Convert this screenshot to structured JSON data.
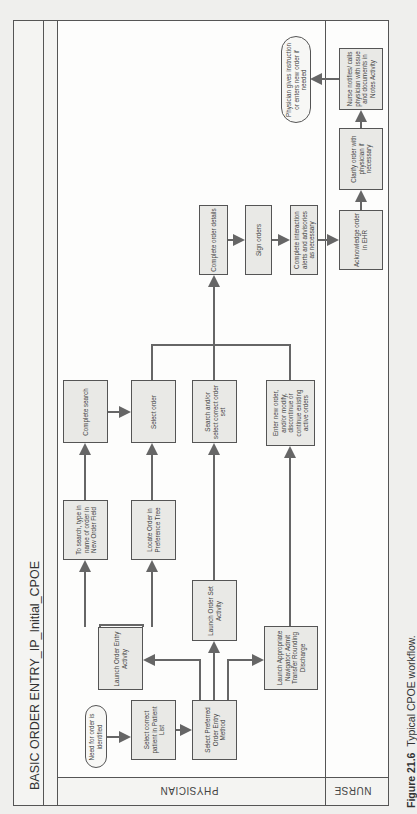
{
  "diagram": {
    "title": "BASIC ORDER ENTRY_IP_Initial_CPOE",
    "lanes": [
      {
        "id": "physician",
        "label": "PHYSICIAN"
      },
      {
        "id": "nurse",
        "label": "NURSE"
      }
    ],
    "nodes": {
      "need": "Need for order is identified",
      "select_patient": "Select correct patient in Patient List",
      "select_method": "Select Preferred Order Entry Method",
      "launch_entry": "Launch Order Entry Activity",
      "launch_set": "Launch Order Set Activity",
      "launch_nav": "Launch Appropriate Navigator: Admit Transfer Rounding Discharge",
      "to_search": "To search, type in name of order in New Order Field",
      "locate": "Locate Order in Preference Tree",
      "complete_search": "Complete search",
      "select_order": "Select order",
      "search_set": "Search and/or select correct order set",
      "enter_new": "Enter new order, and/or modify, discontinue or continue existing active orders",
      "complete_details": "Complete order details",
      "sign": "Sign orders",
      "interaction": "Complete interaction alerts and advisories as necessary",
      "acknowledge": "Acknowledge order in EHR",
      "clarify": "Clarify order with physician if necessary",
      "nurse_notifies": "Nurse notifies/ calls physician with issue and documents in Notes Activity",
      "physician_gives": "Physician gives instruction or enters new order if needed"
    },
    "edges": [
      [
        "need",
        "select_patient"
      ],
      [
        "select_patient",
        "select_method"
      ],
      [
        "select_method",
        "launch_entry"
      ],
      [
        "select_method",
        "launch_set"
      ],
      [
        "select_method",
        "launch_nav"
      ],
      [
        "launch_entry",
        "to_search"
      ],
      [
        "launch_entry",
        "locate"
      ],
      [
        "to_search",
        "complete_search"
      ],
      [
        "locate",
        "select_order"
      ],
      [
        "complete_search",
        "select_order"
      ],
      [
        "launch_set",
        "search_set"
      ],
      [
        "launch_nav",
        "enter_new"
      ],
      [
        "select_order",
        "complete_details"
      ],
      [
        "search_set",
        "complete_details"
      ],
      [
        "enter_new",
        "complete_details"
      ],
      [
        "complete_details",
        "sign"
      ],
      [
        "sign",
        "interaction"
      ],
      [
        "interaction",
        "acknowledge"
      ],
      [
        "acknowledge",
        "clarify"
      ],
      [
        "clarify",
        "nurse_notifies"
      ],
      [
        "nurse_notifies",
        "physician_gives"
      ]
    ]
  },
  "caption": {
    "label": "Figure 21.6",
    "text": "Typical CPOE workflow."
  }
}
